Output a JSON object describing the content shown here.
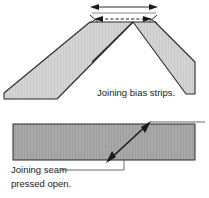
{
  "figure": {
    "background_color": "#ffffff",
    "width": 209,
    "height": 198,
    "labels": {
      "joining_bias_strips": "Joining bias strips.",
      "joining_seam_line1": "Joining seam",
      "joining_seam_line2": "pressed open."
    },
    "colors": {
      "strip_fill_light": "#d2d2d2",
      "strip_fill_medium": "#a6a6a6",
      "outline": "#2b2b2b",
      "leader_line": "#4d4d4d",
      "text": "#1a1a1a",
      "dashed_seam": "#1a1a1a"
    },
    "top_panel": {
      "name": "two bias strips crossed at right angle with seam allowance",
      "left_strip": {
        "label": "left bias strip",
        "fill": "#d2d2d2"
      },
      "right_strip": {
        "label": "right bias strip",
        "fill": "#d2d2d2"
      },
      "width_arrow": {
        "label": "seam allowance width double arrow",
        "style": "double-headed"
      },
      "seam_dashes": {
        "label": "dashed stitching line",
        "style": "dashed with arrowheads both ends"
      }
    },
    "bottom_panel": {
      "name": "joined strip shown flat with diagonal seam pressed open",
      "band": {
        "label": "joined bias strip band",
        "fill": "#a6a6a6"
      },
      "diagonal_seam": {
        "label": "diagonal seam line",
        "style": "solid line with arrowheads both ends"
      },
      "leader_top": {
        "label": "upper leader line to seam"
      },
      "leader_bottom": {
        "label": "lower leader line to caption"
      }
    }
  }
}
